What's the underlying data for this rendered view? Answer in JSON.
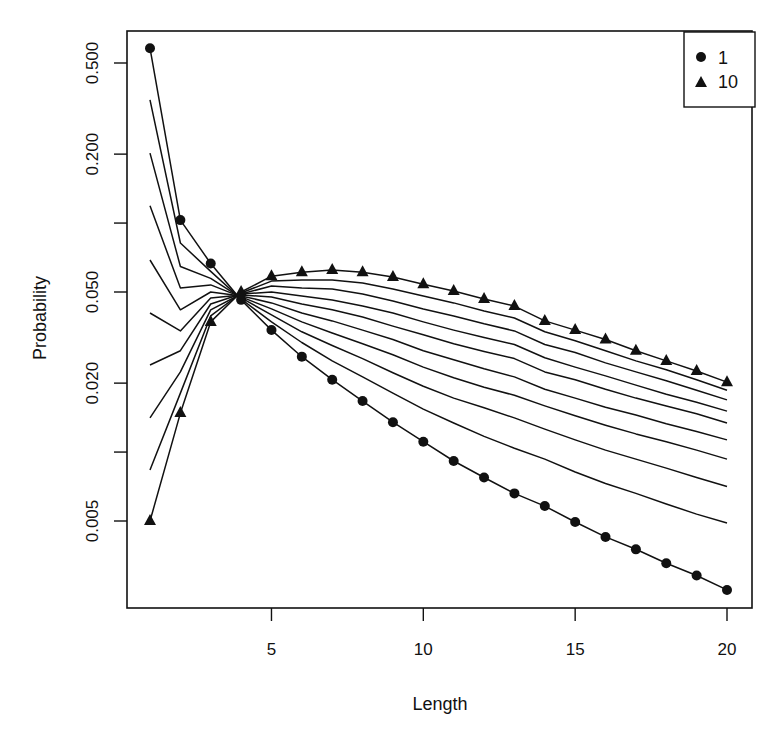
{
  "chart_data": {
    "type": "line",
    "title": "",
    "xlabel": "Length",
    "ylabel": "Probability",
    "xlim": [
      1,
      20
    ],
    "ylim_log": [
      0.0025,
      0.58
    ],
    "y_scale": "log",
    "grid": false,
    "legend_position": "topright",
    "x_ticks": [
      5,
      10,
      15,
      20
    ],
    "y_ticks": [
      0.5,
      0.2,
      0.1,
      0.05,
      0.02,
      0.01,
      0.005
    ],
    "y_tick_labels": [
      "0.500",
      "0.200",
      "",
      "0.050",
      "0.020",
      "",
      "0.005"
    ],
    "x": [
      1,
      2,
      3,
      4,
      5,
      6,
      7,
      8,
      9,
      10,
      11,
      12,
      13,
      14,
      15,
      16,
      17,
      18,
      19,
      20
    ],
    "legend": [
      {
        "label": "1",
        "marker": "circle"
      },
      {
        "label": "10",
        "marker": "triangle"
      }
    ],
    "series": [
      {
        "name": "1",
        "marker": "circle",
        "values": [
          0.58,
          0.103,
          0.0666,
          0.0462,
          0.0341,
          0.0261,
          0.0207,
          0.0167,
          0.0135,
          0.0111,
          0.00914,
          0.00774,
          0.0066,
          0.00581,
          0.00495,
          0.00426,
          0.00376,
          0.00327,
          0.00289,
          0.0025
        ]
      },
      {
        "name": "2",
        "marker": "none",
        "values": [
          0.345,
          0.0818,
          0.0615,
          0.0466,
          0.037,
          0.0301,
          0.025,
          0.0213,
          0.0181,
          0.0154,
          0.0134,
          0.0117,
          0.0104,
          0.00932,
          0.00818,
          0.00729,
          0.0066,
          0.00593,
          0.00536,
          0.0049
        ]
      },
      {
        "name": "3",
        "marker": "none",
        "values": [
          0.202,
          0.0646,
          0.0573,
          0.0471,
          0.0397,
          0.0335,
          0.0292,
          0.0256,
          0.0222,
          0.0194,
          0.0172,
          0.0156,
          0.0141,
          0.0126,
          0.0113,
          0.0102,
          0.00932,
          0.00851,
          0.00774,
          0.00707
        ]
      },
      {
        "name": "4",
        "marker": "none",
        "values": [
          0.119,
          0.052,
          0.0537,
          0.0476,
          0.0422,
          0.037,
          0.0331,
          0.0297,
          0.0266,
          0.0235,
          0.0211,
          0.0192,
          0.0177,
          0.0159,
          0.0144,
          0.0131,
          0.012,
          0.0111,
          0.0102,
          0.00932
        ]
      },
      {
        "name": "5",
        "marker": "none",
        "values": [
          0.069,
          0.0418,
          0.05,
          0.0481,
          0.0448,
          0.0405,
          0.0374,
          0.0341,
          0.031,
          0.0277,
          0.0253,
          0.0231,
          0.0213,
          0.0188,
          0.0172,
          0.0157,
          0.0145,
          0.0133,
          0.0123,
          0.0113
        ]
      },
      {
        "name": "6",
        "marker": "none",
        "values": [
          0.0405,
          0.0338,
          0.0471,
          0.0485,
          0.0476,
          0.0443,
          0.0418,
          0.0389,
          0.0355,
          0.0325,
          0.0297,
          0.0275,
          0.0256,
          0.0224,
          0.0207,
          0.0188,
          0.0172,
          0.0159,
          0.0147,
          0.0134
        ]
      },
      {
        "name": "7",
        "marker": "none",
        "values": [
          0.024,
          0.0277,
          0.0443,
          0.049,
          0.05,
          0.0481,
          0.0462,
          0.0434,
          0.0405,
          0.037,
          0.0341,
          0.0316,
          0.0295,
          0.0258,
          0.0235,
          0.0215,
          0.0196,
          0.0179,
          0.0165,
          0.0151
        ]
      },
      {
        "name": "8",
        "marker": "none",
        "values": [
          0.0141,
          0.0224,
          0.0418,
          0.049,
          0.0531,
          0.052,
          0.0515,
          0.049,
          0.0457,
          0.0422,
          0.0393,
          0.0363,
          0.0338,
          0.0295,
          0.0272,
          0.0245,
          0.0224,
          0.0205,
          0.0186,
          0.0169
        ]
      },
      {
        "name": "9",
        "marker": "none",
        "values": [
          0.00835,
          0.0181,
          0.0393,
          0.0495,
          0.0558,
          0.0564,
          0.0564,
          0.0547,
          0.0515,
          0.0481,
          0.0448,
          0.0413,
          0.0385,
          0.0335,
          0.0306,
          0.0277,
          0.025,
          0.0229,
          0.0207,
          0.0186
        ]
      },
      {
        "name": "10",
        "marker": "triangle",
        "values": [
          0.005,
          0.0148,
          0.037,
          0.05,
          0.0586,
          0.061,
          0.0624,
          0.061,
          0.0581,
          0.0541,
          0.0505,
          0.0466,
          0.0434,
          0.0374,
          0.0341,
          0.031,
          0.0277,
          0.025,
          0.0226,
          0.0202
        ]
      }
    ]
  },
  "axes": {
    "xlabel": "Length",
    "ylabel": "Probability"
  },
  "legend": {
    "items": [
      {
        "label": "1"
      },
      {
        "label": "10"
      }
    ]
  },
  "colors": {
    "ink": "#111111",
    "background": "#ffffff"
  }
}
